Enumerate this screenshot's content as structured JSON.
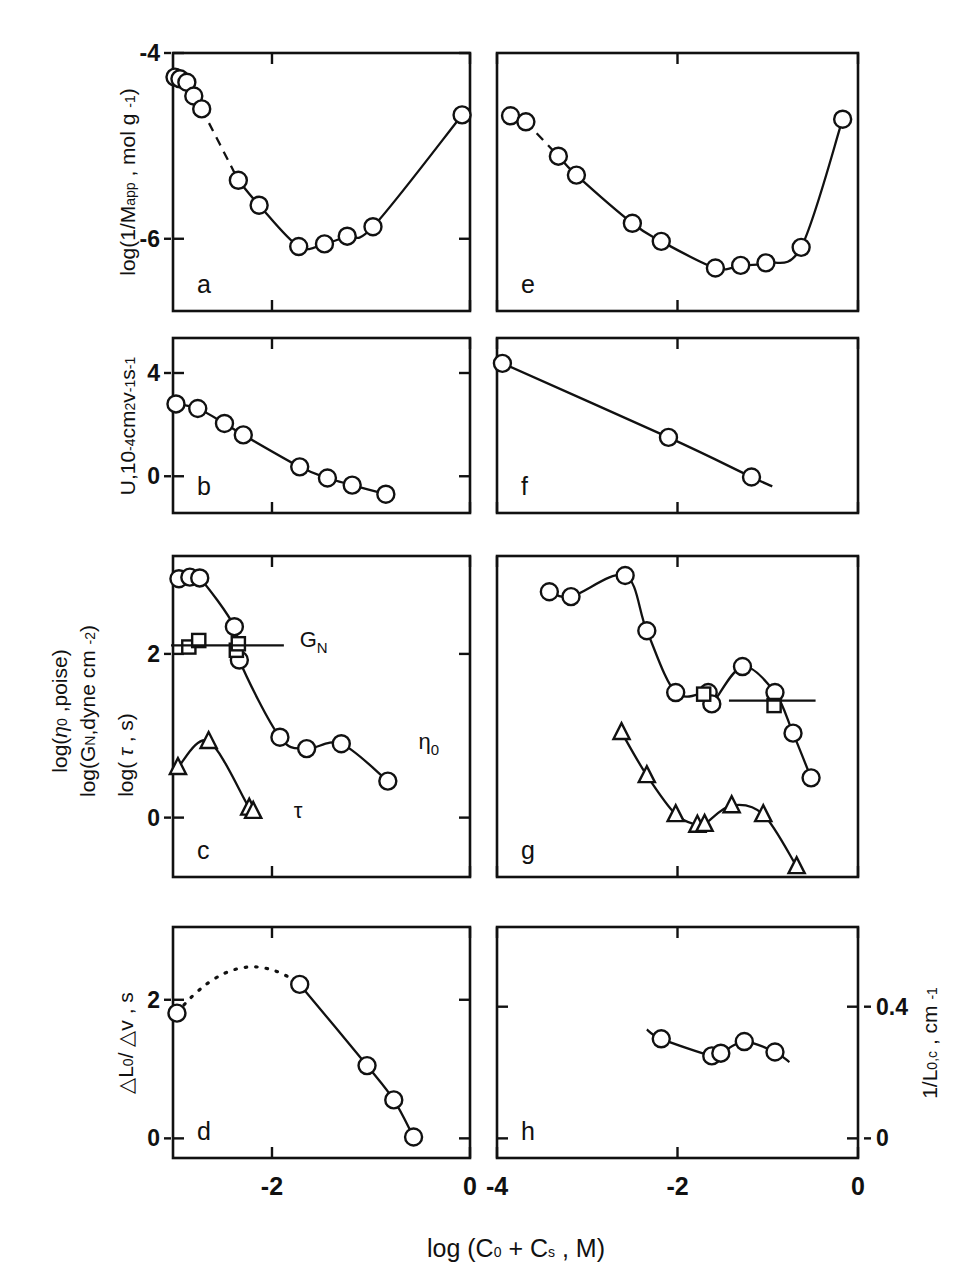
{
  "figure": {
    "width": 973,
    "height": 1285,
    "background": "#ffffff",
    "ink": "#111111",
    "xlabel_main": "log (C₀ + Cₛ , M)",
    "xlabel_parts": {
      "prefix": "log (C",
      "sub1": "0",
      "plus": " + C",
      "sub2": "s",
      "suffix": " , M)"
    }
  },
  "axes": {
    "left_column": {
      "x_ticks": [
        {
          "value": -2,
          "label": "-2",
          "frac": 0.3333
        },
        {
          "value": 0,
          "label": "0",
          "frac": 1.0
        }
      ],
      "xlim": [
        -3.0,
        0.0
      ]
    },
    "right_column": {
      "x_ticks": [
        {
          "value": -4,
          "label": "-4",
          "frac": 0.0
        },
        {
          "value": -2,
          "label": "-2",
          "frac": 0.5
        },
        {
          "value": 0,
          "label": "0",
          "frac": 1.0
        }
      ],
      "xlim": [
        -4.0,
        0.0
      ]
    }
  },
  "panels": [
    {
      "id": "a",
      "letter": "a",
      "column": "left",
      "ylabel_lines": [
        "log(1/M",
        "app",
        " , mol g ",
        "-1",
        ")"
      ],
      "ylabel_plain": "log(1/Mₐₚₚ , mol g ⁻¹)",
      "y_ticks": [
        {
          "value": -4,
          "label": "-4",
          "frac": 1.0
        },
        {
          "value": -6,
          "label": "-6",
          "frac": 0.28
        }
      ],
      "ylim": [
        -6.8,
        -3.8
      ],
      "series": [
        {
          "name": "1/M_app",
          "marker": "circle",
          "line": "mixed",
          "points": [
            {
              "x": -2.98,
              "y": -4.08
            },
            {
              "x": -2.93,
              "y": -4.1
            },
            {
              "x": -2.86,
              "y": -4.14
            },
            {
              "x": -2.79,
              "y": -4.3
            },
            {
              "x": -2.71,
              "y": -4.45
            },
            {
              "x": -2.34,
              "y": -5.28
            },
            {
              "x": -2.13,
              "y": -5.57
            },
            {
              "x": -1.73,
              "y": -6.05
            },
            {
              "x": -1.47,
              "y": -6.02
            },
            {
              "x": -1.24,
              "y": -5.93
            },
            {
              "x": -0.98,
              "y": -5.82
            },
            {
              "x": -0.08,
              "y": -4.52
            }
          ],
          "dashed_between": [
            4,
            5
          ]
        }
      ]
    },
    {
      "id": "b",
      "letter": "b",
      "column": "left",
      "ylabel_lines": [
        "U,10",
        "-4",
        "cm",
        "2",
        "v",
        "-1",
        "s",
        "-1"
      ],
      "ylabel_plain": "U,10⁻⁴cm²v⁻¹s⁻¹",
      "y_ticks": [
        {
          "value": 4,
          "label": "4",
          "frac": 0.8
        },
        {
          "value": 0,
          "label": "0",
          "frac": 0.21
        }
      ],
      "ylim": [
        -1.6,
        5.3
      ],
      "series": [
        {
          "name": "U",
          "marker": "circle",
          "line": "solid",
          "points": [
            {
              "x": -2.97,
              "y": 2.7
            },
            {
              "x": -2.75,
              "y": 2.52
            },
            {
              "x": -2.48,
              "y": 1.93
            },
            {
              "x": -2.29,
              "y": 1.48
            },
            {
              "x": -1.72,
              "y": 0.22
            },
            {
              "x": -1.44,
              "y": -0.22
            },
            {
              "x": -1.19,
              "y": -0.5
            },
            {
              "x": -0.85,
              "y": -0.86
            }
          ]
        }
      ]
    },
    {
      "id": "c",
      "letter": "c",
      "column": "left",
      "ylabel_lines": [
        "log(η",
        "0",
        ",poise)",
        "log(G",
        "N",
        ",dyne cm ",
        "-2",
        ")",
        "log( τ , s)"
      ],
      "ylabel_plain": "log(η₀,poise)  log(G_N,dyne cm ⁻²)  log( τ , s)",
      "y_ticks": [
        {
          "value": 2,
          "label": "2",
          "frac": 0.695
        },
        {
          "value": 0,
          "label": "0",
          "frac": 0.185
        }
      ],
      "ylim": [
        -0.75,
        3.2
      ],
      "annotations": [
        {
          "text": "G",
          "sub": "N",
          "x": -1.72,
          "y": 2.08,
          "name": "gn-annotation"
        },
        {
          "text": "η",
          "sub": "0",
          "x": -0.52,
          "y": 0.82,
          "name": "eta0-annotation"
        },
        {
          "text": "τ",
          "sub": "",
          "x": -1.78,
          "y": -0.02,
          "name": "tau-annotation"
        }
      ],
      "gn_line": {
        "x_start": -3.02,
        "x_end": -1.88,
        "y": 2.1
      },
      "series": [
        {
          "name": "eta0",
          "marker": "circle",
          "line": "solid",
          "points": [
            {
              "x": -2.94,
              "y": 2.92
            },
            {
              "x": -2.83,
              "y": 2.94
            },
            {
              "x": -2.73,
              "y": 2.93
            },
            {
              "x": -2.38,
              "y": 2.33
            },
            {
              "x": -2.33,
              "y": 1.92
            },
            {
              "x": -1.92,
              "y": 0.97
            },
            {
              "x": -1.65,
              "y": 0.83
            },
            {
              "x": -1.3,
              "y": 0.89
            },
            {
              "x": -0.83,
              "y": 0.43
            }
          ]
        },
        {
          "name": "GN",
          "marker": "square",
          "line": "none",
          "points": [
            {
              "x": -2.84,
              "y": 2.08
            },
            {
              "x": -2.74,
              "y": 2.16
            },
            {
              "x": -2.36,
              "y": 2.04
            },
            {
              "x": -2.34,
              "y": 2.12
            }
          ]
        },
        {
          "name": "tau",
          "marker": "triangle",
          "line": "solid",
          "points": [
            {
              "x": -2.95,
              "y": 0.6
            },
            {
              "x": -2.64,
              "y": 0.92
            },
            {
              "x": -2.23,
              "y": 0.1
            },
            {
              "x": -2.19,
              "y": 0.06
            }
          ]
        }
      ]
    },
    {
      "id": "d",
      "letter": "d",
      "column": "left",
      "ylabel_lines": [
        "△L",
        "0",
        "/ △v , s"
      ],
      "ylabel_plain": "△L₀/△v , s",
      "y_ticks": [
        {
          "value": 2,
          "label": "2",
          "frac": 0.685
        },
        {
          "value": 0,
          "label": "0",
          "frac": 0.085
        }
      ],
      "ylim": [
        -0.35,
        2.95
      ],
      "series": [
        {
          "name": "dL0/dv",
          "marker": "circle",
          "line": "mixed-dotted",
          "points": [
            {
              "x": -2.96,
              "y": 1.72
            },
            {
              "x": -1.72,
              "y": 2.13
            },
            {
              "x": -1.04,
              "y": 0.97
            },
            {
              "x": -0.77,
              "y": 0.48
            },
            {
              "x": -0.57,
              "y": -0.05
            }
          ],
          "dotted_between": [
            0,
            1
          ]
        }
      ]
    },
    {
      "id": "e",
      "letter": "e",
      "column": "right",
      "ylabel_plain": "",
      "y_ticks": [],
      "ylim": [
        -6.8,
        -3.8
      ],
      "series": [
        {
          "name": "1/M_app",
          "marker": "circle",
          "line": "mixed",
          "points": [
            {
              "x": -3.85,
              "y": -4.53
            },
            {
              "x": -3.68,
              "y": -4.6
            },
            {
              "x": -3.32,
              "y": -5.0
            },
            {
              "x": -3.12,
              "y": -5.22
            },
            {
              "x": -2.5,
              "y": -5.78
            },
            {
              "x": -2.18,
              "y": -5.99
            },
            {
              "x": -1.58,
              "y": -6.3
            },
            {
              "x": -1.3,
              "y": -6.27
            },
            {
              "x": -1.02,
              "y": -6.24
            },
            {
              "x": -0.63,
              "y": -6.06
            },
            {
              "x": -0.17,
              "y": -4.57
            }
          ],
          "dashed_between": [
            1,
            2
          ]
        }
      ]
    },
    {
      "id": "f",
      "letter": "f",
      "column": "right",
      "ylabel_plain": "",
      "y_ticks": [],
      "ylim": [
        -1.6,
        5.3
      ],
      "series": [
        {
          "name": "U",
          "marker": "circle",
          "line": "solid",
          "points": [
            {
              "x": -3.94,
              "y": 4.3
            },
            {
              "x": -2.1,
              "y": 1.38
            },
            {
              "x": -1.18,
              "y": -0.18
            }
          ],
          "tail": {
            "x": -0.95,
            "y": -0.55
          }
        }
      ]
    },
    {
      "id": "g",
      "letter": "g",
      "column": "right",
      "ylabel_plain": "",
      "y_ticks": [],
      "ylim": [
        -0.75,
        3.2
      ],
      "gn_line": {
        "x_start": -1.43,
        "x_end": -0.47,
        "y": 1.42
      },
      "series": [
        {
          "name": "eta0",
          "marker": "circle",
          "line": "solid",
          "points": [
            {
              "x": -3.42,
              "y": 2.76
            },
            {
              "x": -3.18,
              "y": 2.7
            },
            {
              "x": -2.58,
              "y": 2.96
            },
            {
              "x": -2.34,
              "y": 2.28
            },
            {
              "x": -2.02,
              "y": 1.52
            },
            {
              "x": -1.66,
              "y": 1.52
            },
            {
              "x": -1.62,
              "y": 1.38
            },
            {
              "x": -1.28,
              "y": 1.84
            },
            {
              "x": -0.92,
              "y": 1.52
            },
            {
              "x": -0.72,
              "y": 1.02
            },
            {
              "x": -0.52,
              "y": 0.47
            }
          ]
        },
        {
          "name": "GN",
          "marker": "square",
          "line": "none",
          "points": [
            {
              "x": -1.71,
              "y": 1.5
            },
            {
              "x": -0.93,
              "y": 1.36
            }
          ]
        },
        {
          "name": "tau",
          "marker": "triangle",
          "line": "solid",
          "points": [
            {
              "x": -2.62,
              "y": 1.03
            },
            {
              "x": -2.34,
              "y": 0.5
            },
            {
              "x": -2.02,
              "y": 0.02
            },
            {
              "x": -1.78,
              "y": -0.11
            },
            {
              "x": -1.7,
              "y": -0.1
            },
            {
              "x": -1.4,
              "y": 0.13
            },
            {
              "x": -1.05,
              "y": 0.02
            },
            {
              "x": -0.68,
              "y": -0.62
            }
          ]
        }
      ]
    },
    {
      "id": "h",
      "letter": "h",
      "column": "right",
      "ylabel_plain": "1/L₀,ᴄ , cm ⁻¹",
      "ylabel_lines": [
        "1/L",
        "0,c",
        " , cm ",
        "-1"
      ],
      "y_side": "right",
      "y_ticks": [
        {
          "value": 0.4,
          "label": "0.4",
          "frac": 0.655
        },
        {
          "value": 0,
          "label": "0",
          "frac": 0.085
        }
      ],
      "ylim": [
        -0.035,
        0.56
      ],
      "series": [
        {
          "name": "1/L0c",
          "marker": "circle",
          "line": "solid",
          "points": [
            {
              "x": -2.18,
              "y": 0.272
            },
            {
              "x": -1.62,
              "y": 0.228
            },
            {
              "x": -1.52,
              "y": 0.235
            },
            {
              "x": -1.26,
              "y": 0.265
            },
            {
              "x": -0.92,
              "y": 0.238
            }
          ],
          "head": {
            "x": -2.34,
            "y": 0.296
          },
          "tail": {
            "x": -0.76,
            "y": 0.212
          }
        }
      ]
    }
  ]
}
